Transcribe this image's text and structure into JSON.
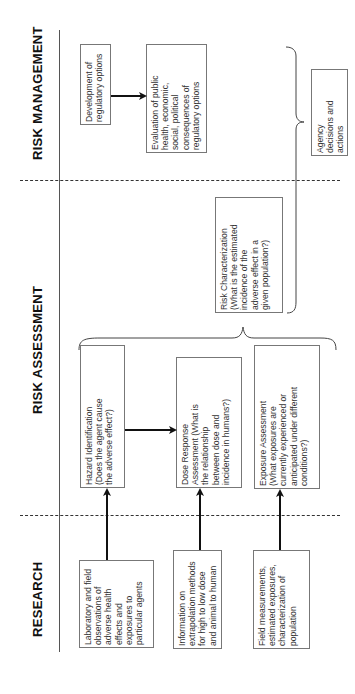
{
  "sections": {
    "risk_management": "RISK MANAGEMENT",
    "risk_assessment": "RISK ASSESSMENT",
    "research": "RESEARCH"
  },
  "risk_management": {
    "development": "Development of\nregulatory options",
    "evaluation": "Evaluation of public\nhealth, economic,\nsocial, political\nconsequences of\nregulatory options",
    "agency": "Agency\ndecisions and\nactions"
  },
  "risk_assessment": {
    "risk_characterization": "Risk Characterization\n(What is the estimated\nincidence of the\nadverse effect in a\ngiven population?)",
    "hazard_identification": "Hazard Identification\n(Does the agent cause\nthe adverse effect?)",
    "dose_response": "Dose Response\nAssessment (What is\nthe relationship\nbetween dose and\nincidence in humans?)",
    "exposure_assessment": "Exposure Assessment\n(What exposures are\ncurrently experienced or\nanticipated under different\nconditions?)"
  },
  "research": {
    "laboratory": "Laboratory and field\nobservations of\nadverse health\neffects and\nexposures to\nparticular agents",
    "extrapolation": "Information on\nextrapolation methods\nfor high to low dose\nand animal to human",
    "field_measurements": "Field measurements,\nestimated exposures,\ncharacterization of\npopulation"
  }
}
